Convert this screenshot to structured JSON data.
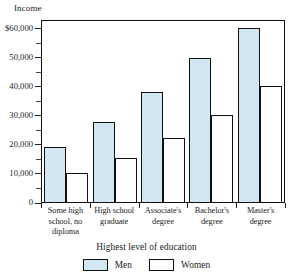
{
  "chart_data": {
    "type": "bar",
    "title": "",
    "ylabel": "Income",
    "xlabel": "Highest level of education",
    "categories": [
      "Some high school, no diploma",
      "High school graduate",
      "Associate's degree",
      "Bachelor's degree",
      "Master's degree"
    ],
    "category_lines": [
      [
        "Some high",
        "school, no",
        "diploma"
      ],
      [
        "High school",
        "graduate"
      ],
      [
        "Associate's",
        "degree"
      ],
      [
        "Bachelor's",
        "degree"
      ],
      [
        "Master's",
        "degree"
      ]
    ],
    "series": [
      {
        "name": "Men",
        "color": "#d3e7f3",
        "values": [
          19000,
          27500,
          38000,
          49500,
          60000
        ]
      },
      {
        "name": "Women",
        "color": "#ffffff",
        "values": [
          10000,
          15000,
          22000,
          30000,
          40000
        ]
      }
    ],
    "ylim": [
      0,
      63000
    ],
    "ytick_values": [
      0,
      10000,
      20000,
      30000,
      40000,
      50000,
      60000
    ],
    "ytick_labels": [
      "0",
      "10,000",
      "20,000",
      "30,000",
      "40,000",
      "50,000",
      "$60,000"
    ],
    "yminor_tick_values": [
      5000,
      15000,
      25000,
      35000,
      45000,
      55000
    ],
    "grid": false,
    "legend_position": "bottom"
  },
  "legend": {
    "entries": [
      {
        "label": "Men"
      },
      {
        "label": "Women"
      }
    ]
  }
}
